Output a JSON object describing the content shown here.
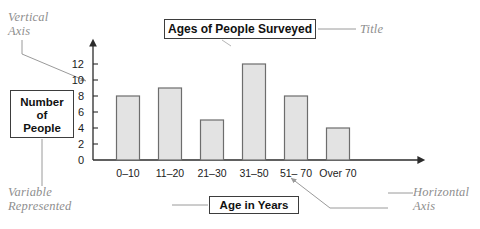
{
  "chart_data": {
    "type": "bar",
    "title": "Ages of People Surveyed",
    "xlabel": "Age in Years",
    "ylabel": "Number of People",
    "categories": [
      "0–10",
      "11–20",
      "21–30",
      "31–50",
      "51– 70",
      "Over 70"
    ],
    "values": [
      8,
      9,
      5,
      12,
      8,
      4
    ],
    "ylim": [
      0,
      13
    ],
    "yticks": [
      0,
      2,
      4,
      6,
      8,
      10,
      12
    ],
    "ytick_labels": [
      "0",
      "2",
      "4",
      "6",
      "8",
      "10",
      "12"
    ],
    "grid": false,
    "legend": null
  },
  "annotations": {
    "vertical_axis": "Vertical\nAxis",
    "variable_represented": "Variable\nRepresented",
    "title_caption": "Title",
    "horizontal_axis": "Horizontal\nAxis"
  },
  "callouts": {
    "title_box": "Ages of People Surveyed",
    "x_axis_box": "Age in Years",
    "y_axis_box_line1": "Number",
    "y_axis_box_line2": "of",
    "y_axis_box_line3": "People"
  },
  "colors": {
    "bar_fill": "#e3e3e3",
    "bar_stroke": "#6d6d6d",
    "axis": "#2b2b2b",
    "annotation_text": "#8e8e8e",
    "leader_line": "#9a9a9a",
    "box_border": "#3d3d3d",
    "background": "#ffffff"
  }
}
